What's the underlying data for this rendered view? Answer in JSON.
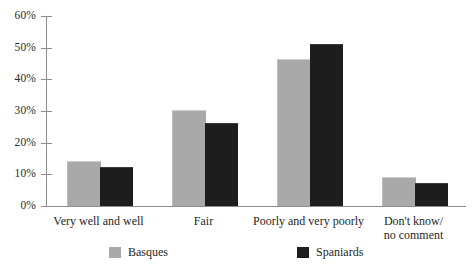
{
  "chart_data": {
    "type": "bar",
    "title": "",
    "subtitle": "",
    "xlabel": "",
    "ylabel": "",
    "ylim": [
      0,
      60
    ],
    "ytick_labels": [
      "0%",
      "10%",
      "20%",
      "30%",
      "40%",
      "50%",
      "60%"
    ],
    "ytick_values": [
      0,
      10,
      20,
      30,
      40,
      50,
      60
    ],
    "grid": false,
    "legend_position": "bottom",
    "value_suffix": "%",
    "categories": [
      "Very well and well",
      "Fair",
      "Poorly and very poorly",
      "Don't know/\nno comment"
    ],
    "category_lines": [
      [
        "Very well and well"
      ],
      [
        "Fair"
      ],
      [
        "Poorly and very poorly"
      ],
      [
        "Don't know/",
        "no comment"
      ]
    ],
    "series": [
      {
        "name": "Basques",
        "color": "#a9a9a9",
        "values": [
          14,
          30,
          46,
          9
        ]
      },
      {
        "name": "Spaniards",
        "color": "#1d1d1d",
        "values": [
          12,
          26,
          51,
          7
        ]
      }
    ]
  },
  "legend": {
    "items": [
      {
        "label": "Basques",
        "swatch": "gray-swatch-icon"
      },
      {
        "label": "Spaniards",
        "swatch": "black-swatch-icon"
      }
    ]
  }
}
